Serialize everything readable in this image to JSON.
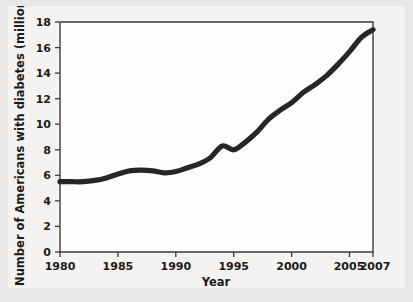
{
  "chart_data": {
    "type": "line",
    "title": "",
    "xlabel": "Year",
    "ylabel": "Number of Americans with diabetes (millions)",
    "xlim": [
      1980,
      2007
    ],
    "ylim": [
      0,
      18
    ],
    "grid": false,
    "legend": "none",
    "x_ticks": [
      "1980",
      "1985",
      "1990",
      "1995",
      "2000",
      "2005",
      "2007"
    ],
    "x_tick_values": [
      1980,
      1985,
      1990,
      1995,
      2000,
      2005,
      2007
    ],
    "y_ticks": [
      "0",
      "2",
      "4",
      "6",
      "8",
      "10",
      "12",
      "14",
      "16",
      "18"
    ],
    "y_tick_values": [
      0,
      2,
      4,
      6,
      8,
      10,
      12,
      14,
      16,
      18
    ],
    "series": [
      {
        "name": "Number of Americans with diabetes (millions)",
        "color": "#262626",
        "x": [
          1980,
          1981,
          1982,
          1983,
          1984,
          1985,
          1986,
          1987,
          1988,
          1989,
          1990,
          1991,
          1992,
          1993,
          1994,
          1995,
          1996,
          1997,
          1998,
          1999,
          2000,
          2001,
          2002,
          2003,
          2004,
          2005,
          2006,
          2007
        ],
        "values": [
          5.5,
          5.5,
          5.5,
          5.6,
          5.8,
          6.1,
          6.35,
          6.4,
          6.35,
          6.2,
          6.3,
          6.6,
          6.9,
          7.4,
          8.3,
          8.0,
          8.6,
          9.4,
          10.4,
          11.1,
          11.7,
          12.5,
          13.1,
          13.8,
          14.7,
          15.7,
          16.8,
          17.4
        ]
      }
    ],
    "annotations": []
  },
  "figure": {
    "background_color": "#e9e8e6",
    "panel_color": "#f4f3f1",
    "plot_area_color": "#fdfdfc",
    "axis_color": "#3a3a3a",
    "line_color": "#262626"
  }
}
